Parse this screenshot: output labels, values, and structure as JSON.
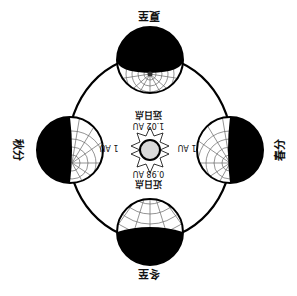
{
  "diagram": {
    "rotation_deg": 180,
    "colors": {
      "ink": "#000000",
      "grid": "#666666",
      "sun_fill": "#d9d9d9",
      "background": "#ffffff"
    },
    "sun": {
      "label": "sun",
      "icon": "sun-icon"
    },
    "distances": {
      "aphelion_name": "远日点",
      "aphelion_value": "1.02 AU",
      "perihelion_name": "近日点",
      "perihelion_value": "0.98 AU",
      "left_au": "1 AU",
      "right_au": "1 AU"
    },
    "positions": {
      "summer_solstice": "夏至",
      "winter_solstice": "冬至",
      "spring_equinox": "春分",
      "autumn_equinox": "秋分"
    }
  }
}
